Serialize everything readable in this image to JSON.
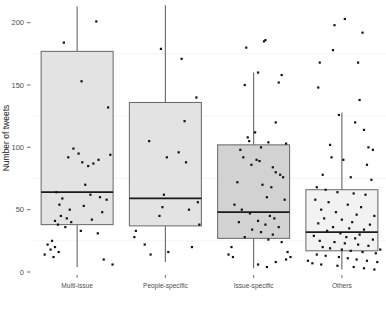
{
  "chart_data": {
    "type": "box",
    "title": "",
    "xlabel": "",
    "ylabel": "Number of tweets",
    "ylim": [
      0,
      215
    ],
    "y_ticks": [
      0,
      50,
      100,
      150,
      200
    ],
    "y_tick_labels": [
      "0",
      "50",
      "100",
      "150",
      "200"
    ],
    "grid": false,
    "legend": "none",
    "categories": [
      "Multi-issue",
      "People-specific",
      "Issue-specific",
      "Others"
    ],
    "boxes": [
      {
        "category": "Multi-issue",
        "lower_whisker": 4,
        "q1": 38,
        "median": 64,
        "q3": 177,
        "upper_whisker": 213,
        "fill": "#e3e3e3",
        "points": [
          {
            "x": 0.26,
            "y": 201
          },
          {
            "x": -0.18,
            "y": 184
          },
          {
            "x": 0.06,
            "y": 153
          },
          {
            "x": 0.42,
            "y": 132
          },
          {
            "x": -0.05,
            "y": 99
          },
          {
            "x": 0.02,
            "y": 95
          },
          {
            "x": 0.45,
            "y": 94
          },
          {
            "x": -0.12,
            "y": 92
          },
          {
            "x": 0.29,
            "y": 90
          },
          {
            "x": 0.07,
            "y": 88
          },
          {
            "x": 0.22,
            "y": 87
          },
          {
            "x": 0.15,
            "y": 85
          },
          {
            "x": 0.11,
            "y": 70
          },
          {
            "x": -0.28,
            "y": 64
          },
          {
            "x": 0.18,
            "y": 62
          },
          {
            "x": 0.31,
            "y": 60
          },
          {
            "x": -0.2,
            "y": 59
          },
          {
            "x": 0.4,
            "y": 58
          },
          {
            "x": -0.24,
            "y": 54
          },
          {
            "x": 0.09,
            "y": 53
          },
          {
            "x": -0.1,
            "y": 50
          },
          {
            "x": 0.34,
            "y": 48
          },
          {
            "x": -0.22,
            "y": 45
          },
          {
            "x": -0.14,
            "y": 43
          },
          {
            "x": 0.2,
            "y": 42
          },
          {
            "x": -0.3,
            "y": 41
          },
          {
            "x": -0.08,
            "y": 40
          },
          {
            "x": -0.26,
            "y": 38
          },
          {
            "x": -0.16,
            "y": 36
          },
          {
            "x": 0.05,
            "y": 33
          },
          {
            "x": 0.28,
            "y": 31
          },
          {
            "x": -0.34,
            "y": 25
          },
          {
            "x": -0.4,
            "y": 22
          },
          {
            "x": -0.3,
            "y": 20
          },
          {
            "x": -0.36,
            "y": 18
          },
          {
            "x": -0.25,
            "y": 16
          },
          {
            "x": -0.44,
            "y": 14
          },
          {
            "x": -0.32,
            "y": 12
          },
          {
            "x": 0.36,
            "y": 10
          },
          {
            "x": 0.48,
            "y": 6
          }
        ]
      },
      {
        "category": "People-specific",
        "lower_whisker": 8,
        "q1": 37,
        "median": 59,
        "q3": 136,
        "upper_whisker": 214,
        "fill": "#e3e3e3",
        "points": [
          {
            "x": -0.06,
            "y": 179
          },
          {
            "x": 0.22,
            "y": 171
          },
          {
            "x": 0.42,
            "y": 140
          },
          {
            "x": 0.26,
            "y": 121
          },
          {
            "x": -0.22,
            "y": 105
          },
          {
            "x": 0.18,
            "y": 96
          },
          {
            "x": 0.02,
            "y": 92
          },
          {
            "x": 0.28,
            "y": 88
          },
          {
            "x": -0.02,
            "y": 62
          },
          {
            "x": 0.44,
            "y": 56
          },
          {
            "x": -0.04,
            "y": 52
          },
          {
            "x": 0.32,
            "y": 50
          },
          {
            "x": -0.08,
            "y": 45
          },
          {
            "x": 0.46,
            "y": 38
          },
          {
            "x": -0.4,
            "y": 33
          },
          {
            "x": -0.42,
            "y": 28
          },
          {
            "x": -0.28,
            "y": 22
          },
          {
            "x": 0.36,
            "y": 20
          },
          {
            "x": -0.2,
            "y": 14
          },
          {
            "x": 0.04,
            "y": 16
          }
        ]
      },
      {
        "category": "Issue-specific",
        "lower_whisker": 3,
        "q1": 27,
        "median": 48,
        "q3": 102,
        "upper_whisker": 160,
        "fill": "#d2d2d2",
        "points": [
          {
            "x": 0.14,
            "y": 185
          },
          {
            "x": 0.16,
            "y": 186
          },
          {
            "x": -0.1,
            "y": 180
          },
          {
            "x": 0.06,
            "y": 160
          },
          {
            "x": 0.38,
            "y": 158
          },
          {
            "x": -0.12,
            "y": 150
          },
          {
            "x": 0.34,
            "y": 152
          },
          {
            "x": 0.3,
            "y": 120
          },
          {
            "x": 0.02,
            "y": 112
          },
          {
            "x": -0.08,
            "y": 108
          },
          {
            "x": -0.06,
            "y": 105
          },
          {
            "x": 0.2,
            "y": 104
          },
          {
            "x": 0.44,
            "y": 103
          },
          {
            "x": 0.1,
            "y": 100
          },
          {
            "x": -0.18,
            "y": 98
          },
          {
            "x": -0.14,
            "y": 92
          },
          {
            "x": 0.04,
            "y": 90
          },
          {
            "x": 0.08,
            "y": 89
          },
          {
            "x": -0.03,
            "y": 86
          },
          {
            "x": 0.26,
            "y": 84
          },
          {
            "x": 0.3,
            "y": 80
          },
          {
            "x": 0.36,
            "y": 78
          },
          {
            "x": 0.4,
            "y": 76
          },
          {
            "x": -0.22,
            "y": 72
          },
          {
            "x": 0.12,
            "y": 70
          },
          {
            "x": 0.24,
            "y": 68
          },
          {
            "x": 0.18,
            "y": 60
          },
          {
            "x": 0.42,
            "y": 58
          },
          {
            "x": -0.26,
            "y": 54
          },
          {
            "x": -0.16,
            "y": 50
          },
          {
            "x": -0.05,
            "y": 47
          },
          {
            "x": 0.22,
            "y": 45
          },
          {
            "x": 0.28,
            "y": 43
          },
          {
            "x": 0.06,
            "y": 41
          },
          {
            "x": -0.2,
            "y": 40
          },
          {
            "x": 0.16,
            "y": 38
          },
          {
            "x": 0.34,
            "y": 36
          },
          {
            "x": -0.02,
            "y": 34
          },
          {
            "x": 0.1,
            "y": 32
          },
          {
            "x": 0.26,
            "y": 30
          },
          {
            "x": -0.12,
            "y": 28
          },
          {
            "x": 0.2,
            "y": 26
          },
          {
            "x": 0.38,
            "y": 24
          },
          {
            "x": -0.3,
            "y": 20
          },
          {
            "x": -0.34,
            "y": 14
          },
          {
            "x": -0.28,
            "y": 12
          },
          {
            "x": 0.46,
            "y": 16
          },
          {
            "x": 0.5,
            "y": 12
          },
          {
            "x": 0.44,
            "y": 10
          },
          {
            "x": 0.06,
            "y": 6
          },
          {
            "x": 0.3,
            "y": 8
          },
          {
            "x": 0.18,
            "y": 4
          }
        ]
      },
      {
        "category": "Others",
        "lower_whisker": 2,
        "q1": 17,
        "median": 32,
        "q3": 66,
        "upper_whisker": 128,
        "fill": "#f2f2f2",
        "points": [
          {
            "x": -0.1,
            "y": 198
          },
          {
            "x": 0.04,
            "y": 203
          },
          {
            "x": 0.28,
            "y": 192
          },
          {
            "x": -0.12,
            "y": 178
          },
          {
            "x": -0.3,
            "y": 168
          },
          {
            "x": 0.22,
            "y": 168
          },
          {
            "x": -0.32,
            "y": 148
          },
          {
            "x": 0.24,
            "y": 138
          },
          {
            "x": -0.04,
            "y": 126
          },
          {
            "x": 0.18,
            "y": 120
          },
          {
            "x": 0.3,
            "y": 114
          },
          {
            "x": -0.16,
            "y": 102
          },
          {
            "x": 0.36,
            "y": 100
          },
          {
            "x": 0.42,
            "y": 98
          },
          {
            "x": -0.14,
            "y": 92
          },
          {
            "x": 0.02,
            "y": 90
          },
          {
            "x": 0.34,
            "y": 86
          },
          {
            "x": -0.26,
            "y": 78
          },
          {
            "x": 0.12,
            "y": 76
          },
          {
            "x": 0.4,
            "y": 74
          },
          {
            "x": -0.34,
            "y": 68
          },
          {
            "x": -0.22,
            "y": 66
          },
          {
            "x": -0.06,
            "y": 64
          },
          {
            "x": 0.16,
            "y": 63
          },
          {
            "x": 0.32,
            "y": 62
          },
          {
            "x": -0.36,
            "y": 58
          },
          {
            "x": -0.18,
            "y": 56
          },
          {
            "x": 0.08,
            "y": 54
          },
          {
            "x": 0.26,
            "y": 52
          },
          {
            "x": -0.28,
            "y": 50
          },
          {
            "x": -0.08,
            "y": 48
          },
          {
            "x": 0.2,
            "y": 46
          },
          {
            "x": 0.44,
            "y": 45
          },
          {
            "x": -0.24,
            "y": 43
          },
          {
            "x": 0.0,
            "y": 42
          },
          {
            "x": 0.14,
            "y": 40
          },
          {
            "x": -0.32,
            "y": 39
          },
          {
            "x": 0.38,
            "y": 38
          },
          {
            "x": -0.12,
            "y": 36
          },
          {
            "x": 0.1,
            "y": 35
          },
          {
            "x": 0.3,
            "y": 34
          },
          {
            "x": -0.2,
            "y": 33
          },
          {
            "x": -0.02,
            "y": 31
          },
          {
            "x": 0.24,
            "y": 30
          },
          {
            "x": -0.38,
            "y": 29
          },
          {
            "x": 0.06,
            "y": 28
          },
          {
            "x": 0.18,
            "y": 27
          },
          {
            "x": 0.42,
            "y": 26
          },
          {
            "x": -0.3,
            "y": 25
          },
          {
            "x": -0.1,
            "y": 24
          },
          {
            "x": 0.04,
            "y": 23
          },
          {
            "x": 0.22,
            "y": 22
          },
          {
            "x": 0.36,
            "y": 21
          },
          {
            "x": -0.26,
            "y": 20
          },
          {
            "x": -0.16,
            "y": 19
          },
          {
            "x": 0.0,
            "y": 18
          },
          {
            "x": 0.12,
            "y": 17
          },
          {
            "x": 0.28,
            "y": 16
          },
          {
            "x": 0.46,
            "y": 15
          },
          {
            "x": -0.34,
            "y": 14
          },
          {
            "x": -0.22,
            "y": 13
          },
          {
            "x": -0.04,
            "y": 12
          },
          {
            "x": 0.08,
            "y": 11
          },
          {
            "x": 0.2,
            "y": 10
          },
          {
            "x": 0.34,
            "y": 9
          },
          {
            "x": 0.48,
            "y": 8
          },
          {
            "x": -0.4,
            "y": 7
          },
          {
            "x": -0.28,
            "y": 6
          },
          {
            "x": -0.06,
            "y": 5
          },
          {
            "x": 0.16,
            "y": 4
          },
          {
            "x": 0.3,
            "y": 3
          },
          {
            "x": 0.44,
            "y": 2
          },
          {
            "x": 0.52,
            "y": 18
          },
          {
            "x": -0.46,
            "y": 9
          }
        ]
      }
    ],
    "colors": {
      "point": "#111111",
      "box_stroke": "#666666",
      "median_stroke": "#1a1a1a",
      "whisker": "#666666",
      "axis_text": "#4d4d4d",
      "background": "#ffffff"
    }
  }
}
